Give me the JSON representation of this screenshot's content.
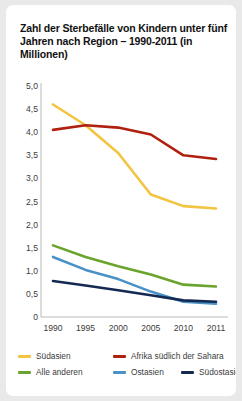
{
  "chart_data": {
    "type": "line",
    "title": "Zahl der Sterbefälle von Kindern unter fünf Jahren nach Region – 1990-2011 (in Millionen)",
    "xlabel": "",
    "ylabel": "",
    "grid": false,
    "legend_position": "bottom",
    "x": [
      "1990",
      "1995",
      "2000",
      "2005",
      "2010",
      "2011"
    ],
    "xtick_labels": [
      "1990",
      "1995",
      "2000",
      "2005",
      "2010",
      "2011"
    ],
    "ytick_labels": [
      "5,0",
      "4,5",
      "4,0",
      "3,5",
      "3,0",
      "2,5",
      "2,0",
      "1,5",
      "1,0",
      "0,5",
      "0"
    ],
    "ytick_values": [
      5.0,
      4.5,
      4.0,
      3.5,
      3.0,
      2.5,
      2.0,
      1.5,
      1.0,
      0.5,
      0
    ],
    "ylim": [
      0,
      5.0
    ],
    "series": [
      {
        "name": "Südasien",
        "color": "#f2c43f",
        "values": [
          4.6,
          4.15,
          3.55,
          2.65,
          2.4,
          2.35
        ]
      },
      {
        "name": "Afrika südlich der Sahara",
        "color": "#b0200f",
        "values": [
          4.05,
          4.15,
          4.1,
          3.95,
          3.5,
          3.42
        ]
      },
      {
        "name": "Alle anderen",
        "color": "#6aa42c",
        "values": [
          1.55,
          1.3,
          1.1,
          0.92,
          0.7,
          0.66
        ]
      },
      {
        "name": "Ostasien",
        "color": "#4a92c6",
        "values": [
          1.3,
          1.02,
          0.82,
          0.55,
          0.33,
          0.29
        ]
      },
      {
        "name": "Südostasien",
        "color": "#152a52",
        "values": [
          0.78,
          0.68,
          0.58,
          0.47,
          0.36,
          0.33
        ]
      }
    ]
  },
  "legend": {
    "items": [
      {
        "label": "Südasien",
        "color": "#f2c43f"
      },
      {
        "label": "Afrika südlich der Sahara",
        "color": "#b0200f"
      },
      {
        "label": "Alle anderen",
        "color": "#6aa42c"
      },
      {
        "label": "Ostasien",
        "color": "#4a92c6"
      },
      {
        "label": "Südostasien",
        "color": "#152a52"
      }
    ]
  },
  "axis": {
    "line_color": "#b9b9b9"
  }
}
